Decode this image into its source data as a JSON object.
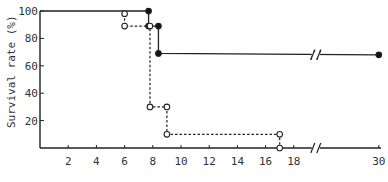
{
  "chart_data": {
    "type": "line",
    "title": "",
    "xlabel": "",
    "ylabel": "Survival rate (%)",
    "xlim": [
      0,
      30
    ],
    "ylim": [
      0,
      100
    ],
    "x_axis_break": {
      "between": [
        18,
        30
      ]
    },
    "grid": false,
    "legend": null,
    "x_ticks": [
      2,
      4,
      6,
      8,
      10,
      12,
      14,
      16,
      18,
      30
    ],
    "y_ticks": [
      20,
      40,
      60,
      80,
      100
    ],
    "series": [
      {
        "name": "Group A (filled circles, solid line)",
        "style": "step-solid",
        "marker": "filled-circle",
        "points": [
          {
            "x": 0,
            "y": 100
          },
          {
            "x": 7.7,
            "y": 100
          },
          {
            "x": 7.7,
            "y": 89
          },
          {
            "x": 8.4,
            "y": 89
          },
          {
            "x": 8.4,
            "y": 69
          },
          {
            "x": 30,
            "y": 68
          }
        ]
      },
      {
        "name": "Group B (open circles, dashed line)",
        "style": "step-dashed",
        "marker": "open-circle",
        "points": [
          {
            "x": 6,
            "y": 98
          },
          {
            "x": 6,
            "y": 89
          },
          {
            "x": 7.8,
            "y": 89
          },
          {
            "x": 7.8,
            "y": 30
          },
          {
            "x": 9,
            "y": 30
          },
          {
            "x": 9,
            "y": 10
          },
          {
            "x": 17,
            "y": 10
          },
          {
            "x": 17,
            "y": 0
          }
        ]
      }
    ]
  },
  "axis": {
    "ylabel": "Survival rate (%)",
    "y_tick_labels": [
      "100",
      "80",
      "60",
      "40",
      "20"
    ],
    "x_tick_labels": [
      "2",
      "4",
      "6",
      "8",
      "10",
      "12",
      "14",
      "16",
      "18",
      "30"
    ]
  }
}
